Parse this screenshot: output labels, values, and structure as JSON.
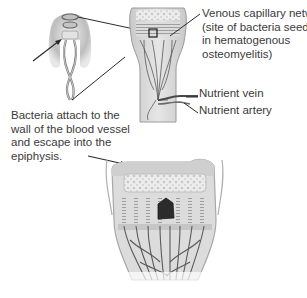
{
  "figure": {
    "panels": [
      {
        "name": "limb-overview",
        "description": "Leg outline showing bone with highlighted growth region"
      },
      {
        "name": "bone-end-section",
        "description": "Longitudinal section of long bone end with nutrient vessels and boxed capillary region"
      },
      {
        "name": "epiphysis-magnified",
        "description": "Magnified epiphysis/growth plate with vascular loops and dark abscess focus"
      }
    ]
  },
  "labels": {
    "venous_network": {
      "lines": [
        "Venous capillary network",
        "(site of bacteria seeding",
        "in hematogenous",
        "osteomyelitis)"
      ]
    },
    "nutrient_vein": {
      "text": "Nutrient vein"
    },
    "nutrient_artery": {
      "text": "Nutrient artery"
    },
    "bacteria_note": {
      "lines": [
        "Bacteria attach to the",
        "wall of the blood vessel",
        "and escape into the",
        "epiphysis."
      ]
    }
  },
  "colors": {
    "text": "#3a3a3a",
    "leader_line": "#2a2a2a",
    "bone_fill": "#d9d9d9",
    "cortex": "#bdbdbd",
    "vessel": "#5a5a5a",
    "abscess": "#2b2b2b",
    "background": "#ffffff"
  }
}
